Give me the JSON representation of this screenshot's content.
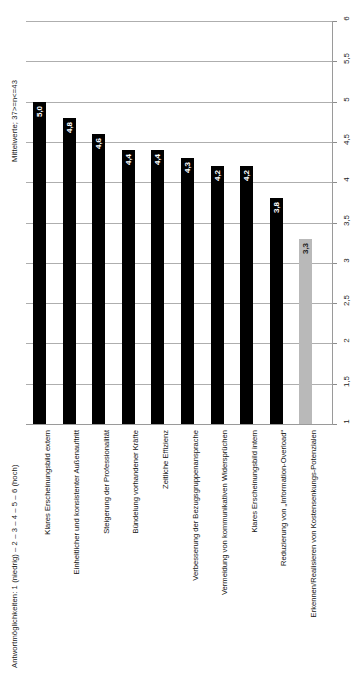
{
  "captions": {
    "scale_note": "Antwortmöglichkeiten: 1 (niedrig) – 2 – 3 – 4 – 5 – 6 (hoch)",
    "sample_note": "Mittelwerte; 37>=n<=43"
  },
  "chart_data": {
    "type": "bar",
    "title": "",
    "xlabel": "",
    "ylabel": "Mittelwerte; 37>=n<=43",
    "ylim": [
      1,
      6
    ],
    "grid": true,
    "orientation": "vertical",
    "legend": "none",
    "yticks": [
      1,
      1.5,
      2,
      2.5,
      3,
      3.5,
      4,
      4.5,
      5,
      5.5,
      6
    ],
    "ytick_labels": [
      "1",
      "1,5",
      "2",
      "2,5",
      "3",
      "3,5",
      "4",
      "4,5",
      "5",
      "5,5",
      "6"
    ],
    "categories": [
      "Klares Erscheinungsbild extern",
      "Einheitlicher und konsistenter Außenauftritt",
      "Steigerung der Professionalität",
      "Bündelung vorhandener Kräfte",
      "Zeitliche Effizienz",
      "Verbesserung der Bezugsgruppenansprache",
      "Vermeidung von kommunikativen Widersprüchen",
      "Klares Erscheinungsbild intern",
      "Reduzierung von „Information-Overload“",
      "Erkennen/Realisieren von Kostensenkungs-Potenzialen"
    ],
    "values": [
      5.0,
      4.8,
      4.6,
      4.4,
      4.4,
      4.3,
      4.2,
      4.2,
      3.8,
      3.3
    ],
    "value_labels": [
      "5,0",
      "4,8",
      "4,6",
      "4,4",
      "4,4",
      "4,3",
      "4,2",
      "4,2",
      "3,8",
      "3,3"
    ],
    "bar_colors": [
      "#000000",
      "#000000",
      "#000000",
      "#000000",
      "#000000",
      "#000000",
      "#000000",
      "#000000",
      "#000000",
      "#b9b9b9"
    ]
  },
  "colors": {
    "bar_primary": "#000000",
    "bar_highlight": "#b9b9b9",
    "gridline": "#aeaeae",
    "axis": "#9a9a9a",
    "background": "#ffffff"
  }
}
